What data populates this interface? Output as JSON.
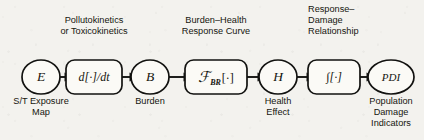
{
  "figure": {
    "background_color": "#f3f2ee",
    "ink_color": "#121210"
  },
  "nodes": [
    {
      "id": "E",
      "shape": "circle",
      "symbol": "E",
      "subscript": "",
      "cx": 41,
      "cy": 77,
      "rx": 19,
      "ry": 17,
      "caption": [
        "S/T Exposure",
        "Map"
      ],
      "caption_align": "center",
      "caption_x": 41,
      "caption_y": 104
    },
    {
      "id": "ddt",
      "shape": "roundrect",
      "symbol": "d[·]/dt",
      "subscript": "",
      "cx": 94,
      "cy": 77,
      "rx": 28,
      "ry": 17,
      "caption": [],
      "caption_align": "center",
      "caption_x": 94,
      "caption_y": 104
    },
    {
      "id": "B",
      "shape": "circle",
      "symbol": "B",
      "subscript": "",
      "cx": 150,
      "cy": 77,
      "rx": 19,
      "ry": 17,
      "caption": [
        "Burden"
      ],
      "caption_align": "center",
      "caption_x": 150,
      "caption_y": 104
    },
    {
      "id": "FBR",
      "shape": "roundrect",
      "symbol": "ℱ",
      "subscript": "BR",
      "cx": 216,
      "cy": 77,
      "rx": 31,
      "ry": 17,
      "caption": [],
      "caption_align": "center",
      "caption_x": 216,
      "caption_y": 104
    },
    {
      "id": "H",
      "shape": "circle",
      "symbol": "H",
      "subscript": "",
      "cx": 278,
      "cy": 77,
      "rx": 19,
      "ry": 17,
      "caption": [
        "Health",
        "Effect"
      ],
      "caption_align": "center",
      "caption_x": 278,
      "caption_y": 104
    },
    {
      "id": "int",
      "shape": "roundrect",
      "symbol": "∫[·]",
      "subscript": "",
      "cx": 334,
      "cy": 77,
      "rx": 26,
      "ry": 17,
      "caption": [],
      "caption_align": "center",
      "caption_x": 334,
      "caption_y": 104
    },
    {
      "id": "PDI",
      "shape": "circle",
      "symbol": "PDI",
      "subscript": "",
      "cx": 391,
      "cy": 77,
      "rx": 23,
      "ry": 17,
      "caption": [
        "Population",
        "Damage",
        "Indicators"
      ],
      "caption_align": "center",
      "caption_x": 391,
      "caption_y": 104
    }
  ],
  "edges": [
    {
      "id": "e1",
      "from": "E",
      "to": "ddt",
      "x1": 60,
      "x2": 66,
      "y": 77
    },
    {
      "id": "e2",
      "from": "ddt",
      "to": "B",
      "x1": 122,
      "x2": 131,
      "y": 77
    },
    {
      "id": "e3",
      "from": "B",
      "to": "FBR",
      "x1": 169,
      "x2": 185,
      "y": 77
    },
    {
      "id": "e4",
      "from": "FBR",
      "to": "H",
      "x1": 247,
      "x2": 259,
      "y": 77
    },
    {
      "id": "e5",
      "from": "H",
      "to": "int",
      "x1": 297,
      "x2": 308,
      "y": 77
    },
    {
      "id": "e6",
      "from": "int",
      "to": "PDI",
      "x1": 360,
      "x2": 368,
      "y": 77
    }
  ],
  "annotations": [
    {
      "id": "pollutokinetics",
      "lines": [
        "Pollutokinetics",
        "or Toxicokinetics"
      ],
      "x": 94,
      "y": 23,
      "align": "center"
    },
    {
      "id": "burden-health",
      "lines": [
        "Burden–Health",
        "Response Curve"
      ],
      "x": 216,
      "y": 23,
      "align": "center"
    },
    {
      "id": "response-damage",
      "lines": [
        "Response–",
        "Damage",
        "Relationship"
      ],
      "x": 308,
      "y": 12,
      "align": "start"
    }
  ]
}
